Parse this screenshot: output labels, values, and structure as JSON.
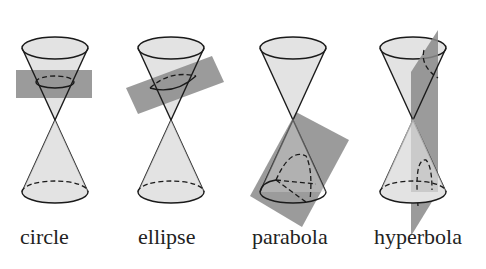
{
  "figure": {
    "panels": [
      {
        "id": "circle",
        "label": "circle"
      },
      {
        "id": "ellipse",
        "label": "ellipse"
      },
      {
        "id": "parabola",
        "label": "parabola"
      },
      {
        "id": "hyperbola",
        "label": "hyperbola"
      }
    ]
  },
  "colors": {
    "background": "#ffffff",
    "cone_fill": "#d9d9d9",
    "cone_stroke": "#1a1a1a",
    "plane_fill": "#8a8a8a",
    "text": "#222222"
  }
}
